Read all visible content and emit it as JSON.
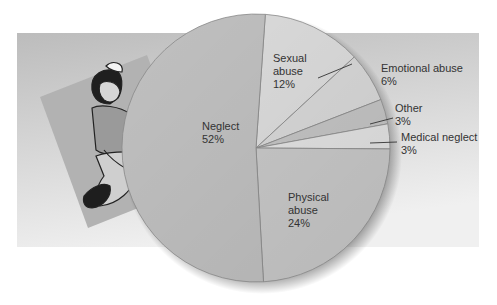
{
  "chart_data": {
    "type": "pie",
    "title": "",
    "slices": [
      {
        "label": "Sexual abuse",
        "value": 12,
        "display": [
          "Sexual",
          "abuse",
          "12%"
        ],
        "color": "#dcdcdc"
      },
      {
        "label": "Emotional abuse",
        "value": 6,
        "display": [
          "Emotional abuse",
          "6%"
        ],
        "color": "#d8d8d8"
      },
      {
        "label": "Other",
        "value": 3,
        "display": [
          "Other",
          "3%"
        ],
        "color": "#c4c4c4"
      },
      {
        "label": "Medical neglect",
        "value": 3,
        "display": [
          "Medical neglect",
          "3%"
        ],
        "color": "#e2e2e2"
      },
      {
        "label": "Physical abuse",
        "value": 24,
        "display": [
          "Physical",
          "abuse",
          "24%"
        ],
        "color": "#c8c8c8"
      },
      {
        "label": "Neglect",
        "value": 52,
        "display": [
          "Neglect",
          "52%"
        ],
        "color": "#c0c0c0"
      }
    ],
    "units": "%",
    "legend": "none (direct labels)"
  },
  "illustration": {
    "subject": "seated-child-illustration"
  },
  "colors": {
    "band_top": "#bdbdbd",
    "band_bottom": "#eeeeee",
    "frame": "#b4b4b4",
    "text": "#333333"
  }
}
